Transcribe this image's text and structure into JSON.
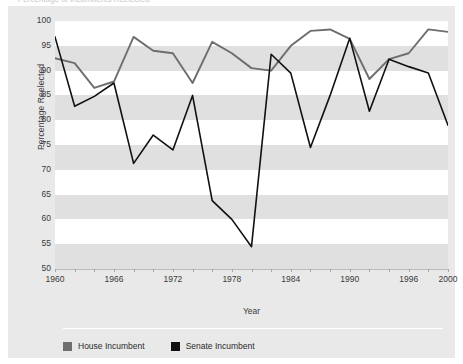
{
  "figure": {
    "title_sliver": "Percentage of Incumbents Reelected",
    "background_color": "#e9e9e9",
    "plot_background_color": "#ffffff",
    "band_color": "#e0e0e0"
  },
  "chart_data": {
    "type": "line",
    "title": "",
    "xlabel": "Year",
    "ylabel": "Percentage Reelected",
    "xlim": [
      1960,
      2000
    ],
    "ylim": [
      50,
      100
    ],
    "yticks": [
      50,
      55,
      60,
      65,
      70,
      75,
      80,
      85,
      90,
      95,
      100
    ],
    "xticks": [
      1960,
      1962,
      1964,
      1966,
      1968,
      1970,
      1972,
      1974,
      1976,
      1978,
      1980,
      1982,
      1984,
      1986,
      1988,
      1990,
      1992,
      1994,
      1996,
      1998,
      2000
    ],
    "xtick_labels": [
      1960,
      1966,
      1972,
      1978,
      1984,
      1990,
      1996,
      2000
    ],
    "grid": "horizontal-bands",
    "legend_position": "below",
    "x": [
      1960,
      1962,
      1964,
      1966,
      1968,
      1970,
      1972,
      1974,
      1976,
      1978,
      1980,
      1982,
      1984,
      1986,
      1988,
      1990,
      1992,
      1994,
      1996,
      1998,
      2000
    ],
    "series": [
      {
        "name": "House Incumbent",
        "color": "#6e6e6e",
        "values": [
          92.5,
          91.5,
          86.5,
          87.8,
          96.8,
          94.0,
          93.5,
          87.5,
          95.8,
          93.5,
          90.5,
          90.0,
          95.0,
          98.0,
          98.3,
          96.4,
          88.3,
          92.3,
          93.5,
          98.3,
          97.8
        ]
      },
      {
        "name": "Senate Incumbent",
        "color": "#111111",
        "values": [
          96.8,
          82.8,
          84.8,
          87.5,
          71.3,
          77.0,
          74.0,
          85.0,
          63.8,
          60.0,
          54.5,
          93.3,
          89.5,
          74.5,
          85.0,
          96.5,
          81.8,
          92.3,
          90.8,
          89.5,
          79.0
        ]
      }
    ]
  },
  "legend": {
    "items": [
      {
        "label": "House Incumbent",
        "color": "#6e6e6e"
      },
      {
        "label": "Senate Incumbent",
        "color": "#111111"
      }
    ]
  }
}
